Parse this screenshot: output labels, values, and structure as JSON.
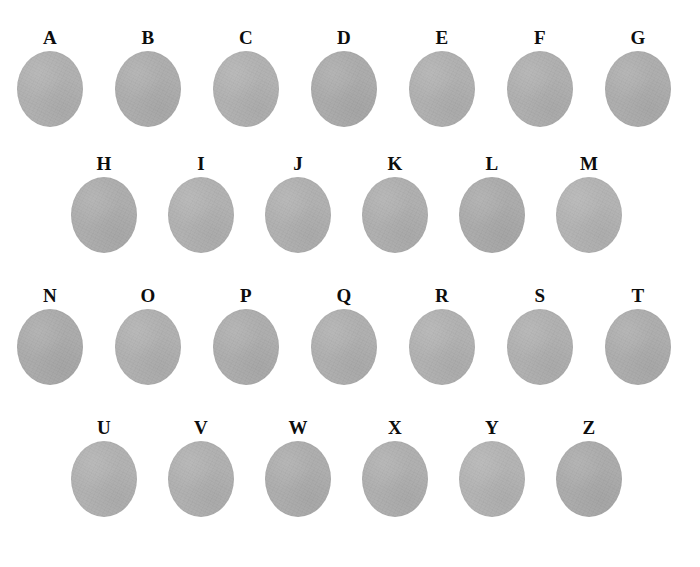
{
  "figure": {
    "background_color": "#ffffff",
    "label_color": "#0d0d0d",
    "disc_color": "#adadad",
    "width": 700,
    "height": 567,
    "rows": [
      {
        "row_id": "row-1",
        "label_y": 28,
        "disc_y": 54,
        "centers": [
          50,
          148,
          246,
          344,
          442,
          540,
          638
        ],
        "items": [
          {
            "label": "A",
            "tone": "v1"
          },
          {
            "label": "B",
            "tone": "v2"
          },
          {
            "label": "C",
            "tone": "v3"
          },
          {
            "label": "D",
            "tone": "v4"
          },
          {
            "label": "E",
            "tone": "v1"
          },
          {
            "label": "F",
            "tone": "v5"
          },
          {
            "label": "G",
            "tone": "v2"
          }
        ]
      },
      {
        "row_id": "row-2",
        "label_y": 154,
        "disc_y": 180,
        "centers": [
          104,
          201,
          298,
          395,
          492,
          589
        ],
        "items": [
          {
            "label": "H",
            "tone": "v2"
          },
          {
            "label": "I",
            "tone": "v3"
          },
          {
            "label": "J",
            "tone": "v1"
          },
          {
            "label": "K",
            "tone": "v5"
          },
          {
            "label": "L",
            "tone": "v4"
          },
          {
            "label": "M",
            "tone": "v6"
          }
        ]
      },
      {
        "row_id": "row-3",
        "label_y": 286,
        "disc_y": 312,
        "centers": [
          50,
          148,
          246,
          344,
          442,
          540,
          638
        ],
        "items": [
          {
            "label": "N",
            "tone": "v4"
          },
          {
            "label": "O",
            "tone": "v1"
          },
          {
            "label": "P",
            "tone": "v2"
          },
          {
            "label": "Q",
            "tone": "v5"
          },
          {
            "label": "R",
            "tone": "v3"
          },
          {
            "label": "S",
            "tone": "v1"
          },
          {
            "label": "T",
            "tone": "v2"
          }
        ]
      },
      {
        "row_id": "row-4",
        "label_y": 418,
        "disc_y": 444,
        "centers": [
          104,
          201,
          298,
          395,
          492,
          589
        ],
        "items": [
          {
            "label": "U",
            "tone": "v3"
          },
          {
            "label": "V",
            "tone": "v1"
          },
          {
            "label": "W",
            "tone": "v2"
          },
          {
            "label": "X",
            "tone": "v5"
          },
          {
            "label": "Y",
            "tone": "v6"
          },
          {
            "label": "Z",
            "tone": "v4"
          }
        ]
      }
    ]
  }
}
